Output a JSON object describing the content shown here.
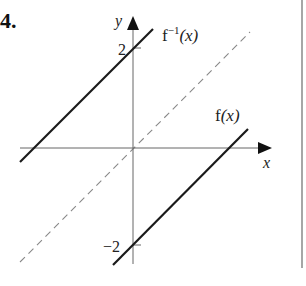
{
  "problem_number": "4.",
  "axes": {
    "x_label": "x",
    "y_label": "y",
    "y_tick_pos": "2",
    "y_tick_neg": "−2"
  },
  "curves": {
    "inverse_label_main": "f",
    "inverse_label_sup": "−1",
    "inverse_label_arg": "(x)",
    "function_label_main": "f",
    "function_label_arg": "(x)",
    "line_y_eq_x": "y = x (dashed)"
  },
  "colors": {
    "line": "#1a1a1a",
    "axis": "#555555",
    "dashed": "#777777",
    "border": "#888888"
  }
}
